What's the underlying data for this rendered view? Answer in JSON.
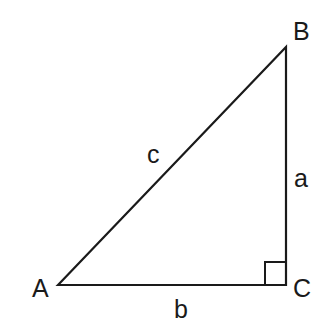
{
  "diagram": {
    "type": "right-triangle",
    "stroke_color": "#1a1a1a",
    "background": "#ffffff",
    "vertices": [
      {
        "id": "A",
        "label": "A",
        "x": 58,
        "y": 285
      },
      {
        "id": "B",
        "label": "B",
        "x": 286,
        "y": 47
      },
      {
        "id": "C",
        "label": "C",
        "x": 286,
        "y": 285
      }
    ],
    "sides": [
      {
        "id": "a",
        "label": "a",
        "from": "B",
        "to": "C"
      },
      {
        "id": "b",
        "label": "b",
        "from": "A",
        "to": "C"
      },
      {
        "id": "c",
        "label": "c",
        "from": "A",
        "to": "B"
      }
    ],
    "right_angle_at": "C"
  }
}
